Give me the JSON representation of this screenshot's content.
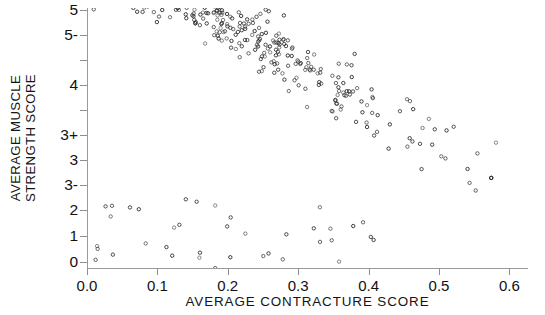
{
  "chart_data": {
    "type": "scatter",
    "title": "",
    "xlabel": "AVERAGE CONTRACTURE SCORE",
    "ylabel_line1": "AVERAGE MUSCLE",
    "ylabel_line2": "STRENGTH SCORE",
    "xlim": [
      0.0,
      0.625
    ],
    "ylim": [
      0,
      9
    ],
    "grid": false,
    "legend": null,
    "marker": {
      "shape": "open-circle",
      "size_px": 3.4,
      "edge_color": "#2a2a2a",
      "face_color": "none"
    },
    "xticks": [
      {
        "value": 0.0,
        "label": "0.0"
      },
      {
        "value": 0.1,
        "label": "0.1"
      },
      {
        "value": 0.2,
        "label": "0.2"
      },
      {
        "value": 0.3,
        "label": "0.3"
      },
      {
        "value": 0.4,
        "label": "0.4"
      },
      {
        "value": 0.5,
        "label": "0.5"
      },
      {
        "value": 0.6,
        "label": "0.6"
      }
    ],
    "yticks": [
      {
        "value": 9,
        "label": "5"
      },
      {
        "value": 8,
        "label": "5-"
      },
      {
        "value": 7,
        "label": ""
      },
      {
        "value": 6,
        "label": "4"
      },
      {
        "value": 5,
        "label": ""
      },
      {
        "value": 4,
        "label": "3+"
      },
      {
        "value": 3,
        "label": "3"
      },
      {
        "value": 2,
        "label": "3-"
      },
      {
        "value": 1,
        "label": "2"
      },
      {
        "value": 0.5,
        "label": "1"
      },
      {
        "value": 0,
        "label": "0"
      }
    ],
    "ytick_pixel_rows": [
      {
        "label": "5",
        "y": 10
      },
      {
        "label": "5-",
        "y": 35
      },
      {
        "label": "",
        "y": 60
      },
      {
        "label": "4",
        "y": 85
      },
      {
        "label": "",
        "y": 110
      },
      {
        "label": "3+",
        "y": 135
      },
      {
        "label": "3",
        "y": 160
      },
      {
        "label": "3-",
        "y": 185
      },
      {
        "label": "2",
        "y": 210
      },
      {
        "label": "1",
        "y": 236
      },
      {
        "label": "0",
        "y": 262
      }
    ],
    "n_points": 1650,
    "series": [
      {
        "name": "patients",
        "trend": {
          "x_start": 0.0,
          "x_end": 0.6,
          "y_start": 6.05,
          "y_end": 2.55,
          "spread_start": 0.85,
          "spread_end": 0.65
        },
        "density_profile": [
          {
            "x": 0.01,
            "weight": 1.0
          },
          {
            "x": 0.05,
            "weight": 0.92
          },
          {
            "x": 0.1,
            "weight": 0.62
          },
          {
            "x": 0.15,
            "weight": 0.44
          },
          {
            "x": 0.2,
            "weight": 0.36
          },
          {
            "x": 0.25,
            "weight": 0.3
          },
          {
            "x": 0.3,
            "weight": 0.25
          },
          {
            "x": 0.35,
            "weight": 0.19
          },
          {
            "x": 0.4,
            "weight": 0.14
          },
          {
            "x": 0.45,
            "weight": 0.1
          },
          {
            "x": 0.5,
            "weight": 0.07
          },
          {
            "x": 0.55,
            "weight": 0.04
          },
          {
            "x": 0.6,
            "weight": 0.02
          }
        ]
      }
    ]
  }
}
